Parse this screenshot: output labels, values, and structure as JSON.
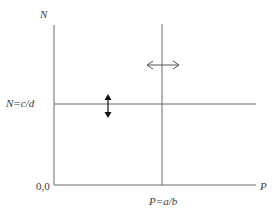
{
  "diagram": {
    "type": "phase-plane",
    "axes": {
      "y_label": "N",
      "x_label": "P",
      "origin_label": "0,0"
    },
    "isoclines": [
      {
        "orientation": "horizontal",
        "label": "N=c/d"
      },
      {
        "orientation": "vertical",
        "label": "P=a/b"
      }
    ],
    "arrows": [
      {
        "type": "vertical-double-arrow",
        "on": "N=c/d"
      },
      {
        "type": "horizontal-double-arrow",
        "on": "P=a/b"
      }
    ],
    "colors": {
      "line": "#555555",
      "arrow": "#111111",
      "text": "#3a3a3a"
    }
  }
}
